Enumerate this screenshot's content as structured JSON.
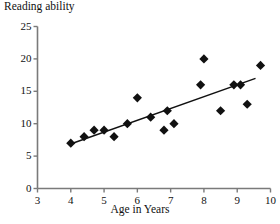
{
  "chart_data": {
    "type": "scatter",
    "title": "Reading ability",
    "subtitle": "",
    "xlabel": "Age in Years",
    "ylabel": "Reading ability",
    "xlim": [
      3,
      10
    ],
    "ylim": [
      0,
      25
    ],
    "xticks": [
      3,
      4,
      5,
      6,
      7,
      8,
      9,
      10
    ],
    "yticks": [
      0,
      5,
      10,
      15,
      20,
      25
    ],
    "xtick_labels": [
      "3",
      "4",
      "5",
      "6",
      "7",
      "8",
      "9",
      "10"
    ],
    "ytick_labels": [
      "0",
      "5",
      "10",
      "15",
      "20",
      "25"
    ],
    "grid": false,
    "legend": false,
    "legend_position": "none",
    "marker": "diamond",
    "marker_color": "#111111",
    "marker_size": 6,
    "axis_color": "#7a7a7a",
    "trendline_color": "#111111",
    "points": [
      {
        "x": 4.0,
        "y": 7
      },
      {
        "x": 4.4,
        "y": 8
      },
      {
        "x": 4.7,
        "y": 9
      },
      {
        "x": 5.0,
        "y": 9
      },
      {
        "x": 5.3,
        "y": 8
      },
      {
        "x": 5.7,
        "y": 10
      },
      {
        "x": 6.0,
        "y": 14
      },
      {
        "x": 6.4,
        "y": 11
      },
      {
        "x": 6.8,
        "y": 9
      },
      {
        "x": 6.9,
        "y": 12
      },
      {
        "x": 7.1,
        "y": 10
      },
      {
        "x": 7.9,
        "y": 16
      },
      {
        "x": 8.0,
        "y": 20
      },
      {
        "x": 8.5,
        "y": 12
      },
      {
        "x": 8.9,
        "y": 16
      },
      {
        "x": 9.1,
        "y": 16
      },
      {
        "x": 9.3,
        "y": 13
      },
      {
        "x": 9.7,
        "y": 19
      }
    ],
    "trendline": {
      "x_start": 3.95,
      "y_start": 6.8,
      "x_end": 9.55,
      "y_end": 17.0
    },
    "annotations": []
  }
}
